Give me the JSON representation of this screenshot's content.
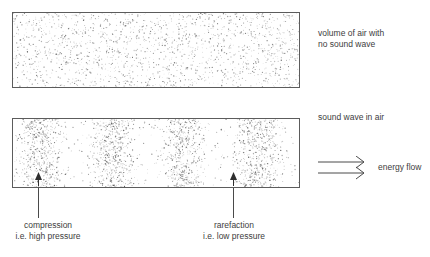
{
  "diagram": {
    "title_hidden": "",
    "boxes": [
      {
        "id": "uniform",
        "name": "volume-of-air-box",
        "label": "volume of air with\nno sound wave",
        "particle_pattern": "uniform-random-stipple",
        "particle_count": 1700,
        "density": "even"
      },
      {
        "id": "wave",
        "name": "sound-wave-box",
        "label": "sound wave in air",
        "particle_pattern": "banded-sinusoidal-stipple",
        "particle_count": 2300,
        "density": "alternating dense and sparse vertical bands",
        "compression_band_centers_px": [
          40,
          113,
          183,
          258
        ],
        "band_count": 4
      }
    ],
    "energy": {
      "label": "energy flow",
      "arrow_count": 2,
      "direction": "right"
    },
    "annotations": [
      {
        "id": "compression",
        "label": "compression\ni.e. high pressure",
        "points_to_px": 38,
        "meaning": "high pressure"
      },
      {
        "id": "rarefaction",
        "label": "rarefaction\ni.e. low pressure",
        "points_to_px": 233,
        "meaning": "low pressure"
      }
    ],
    "colors": {
      "background": "#ffffff",
      "border": "#5c5c5c",
      "text": "#3d3d3d",
      "particle": "#555555",
      "leader": "#4a4a4a"
    }
  }
}
